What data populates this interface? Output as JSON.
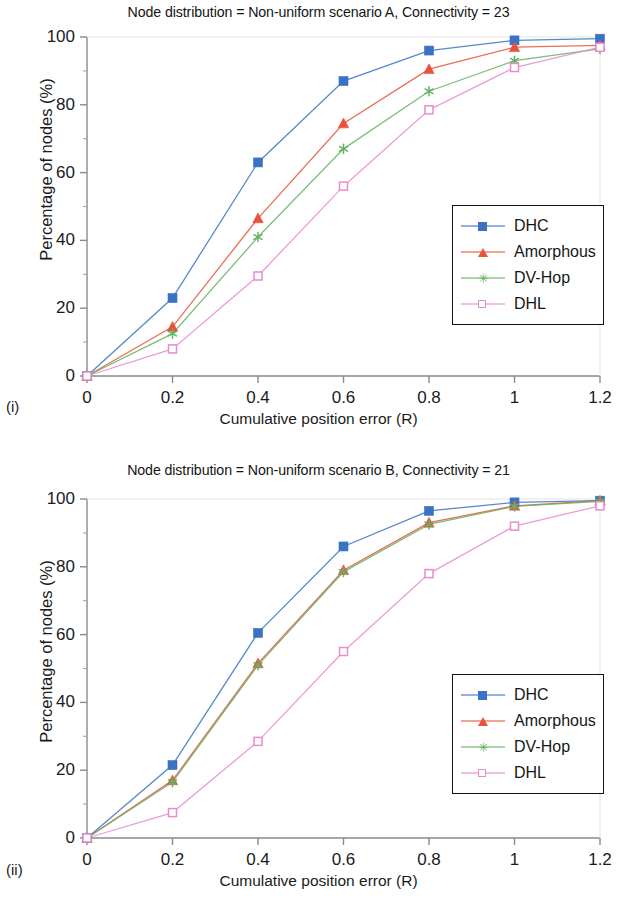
{
  "figure": {
    "panels": [
      {
        "subfig_label": "(i)",
        "title": "Node distribution = Non-uniform scenario A, Connectivity = 23",
        "xlabel": "Cumulative position error (R)",
        "ylabel": "Percentage of nodes (%)"
      },
      {
        "subfig_label": "(ii)",
        "title": "Node distribution = Non-uniform scenario B, Connectivity = 21",
        "xlabel": "Cumulative position error (R)",
        "ylabel": "Percentage of nodes (%)"
      }
    ]
  },
  "legend": {
    "items": [
      {
        "label": "DHC",
        "color": "#3A72C4",
        "marker": "filled-square"
      },
      {
        "label": "Amorphous",
        "color": "#E8533A",
        "marker": "filled-triangle"
      },
      {
        "label": "DV-Hop",
        "color": "#63B363",
        "marker": "star"
      },
      {
        "label": "DHL",
        "color": "#E88BD0",
        "marker": "open-square"
      }
    ]
  },
  "axes": {
    "x_ticks": [
      "0",
      "0.2",
      "0.4",
      "0.6",
      "0.8",
      "1",
      "1.2"
    ],
    "y_ticks": [
      "0",
      "20",
      "40",
      "60",
      "80",
      "100"
    ],
    "xlim": [
      0,
      1.2
    ],
    "ylim": [
      0,
      100
    ]
  },
  "chart_data": [
    {
      "type": "line",
      "id": "panel-i",
      "title": "Node distribution = Non-uniform scenario A, Connectivity = 23",
      "xlabel": "Cumulative position error (R)",
      "ylabel": "Percentage of nodes (%)",
      "x": [
        0,
        0.2,
        0.4,
        0.6,
        0.8,
        1.0,
        1.2
      ],
      "xlim": [
        0,
        1.2
      ],
      "ylim": [
        0,
        100
      ],
      "xtick_labels": [
        "0",
        "0.2",
        "0.4",
        "0.6",
        "0.8",
        "1",
        "1.2"
      ],
      "ytick_labels": [
        "0",
        "20",
        "40",
        "60",
        "80",
        "100"
      ],
      "grid": false,
      "legend_position": "center-right",
      "series": [
        {
          "name": "DHC",
          "color": "#3A72C4",
          "marker": "filled-square",
          "values": [
            0,
            23,
            63,
            87,
            96,
            99,
            99.5
          ]
        },
        {
          "name": "Amorphous",
          "color": "#E8533A",
          "marker": "filled-triangle",
          "values": [
            0,
            14.5,
            46.5,
            74.5,
            90.5,
            97,
            97.5
          ]
        },
        {
          "name": "DV-Hop",
          "color": "#63B363",
          "marker": "star",
          "values": [
            0,
            12.5,
            41,
            67,
            84,
            93,
            96.5
          ]
        },
        {
          "name": "DHL",
          "color": "#E88BD0",
          "marker": "open-square",
          "values": [
            0,
            8,
            29.5,
            56,
            78.5,
            91,
            97
          ]
        }
      ]
    },
    {
      "type": "line",
      "id": "panel-ii",
      "title": "Node distribution = Non-uniform scenario B, Connectivity = 21",
      "xlabel": "Cumulative position error (R)",
      "ylabel": "Percentage of nodes (%)",
      "x": [
        0,
        0.2,
        0.4,
        0.6,
        0.8,
        1.0,
        1.2
      ],
      "xlim": [
        0,
        1.2
      ],
      "ylim": [
        0,
        100
      ],
      "xtick_labels": [
        "0",
        "0.2",
        "0.4",
        "0.6",
        "0.8",
        "1",
        "1.2"
      ],
      "ytick_labels": [
        "0",
        "20",
        "40",
        "60",
        "80",
        "100"
      ],
      "grid": false,
      "legend_position": "center-right",
      "series": [
        {
          "name": "DHC",
          "color": "#3A72C4",
          "marker": "filled-square",
          "values": [
            0,
            21.5,
            60.5,
            86,
            96.5,
            99,
            99.5
          ]
        },
        {
          "name": "Amorphous",
          "color": "#E8533A",
          "marker": "filled-triangle",
          "values": [
            0,
            17,
            51.5,
            79,
            93,
            98,
            99.5
          ]
        },
        {
          "name": "DV-Hop",
          "color": "#63B363",
          "marker": "star",
          "values": [
            0,
            16.5,
            51,
            78.5,
            92.5,
            97.8,
            99.3
          ]
        },
        {
          "name": "DHL",
          "color": "#E88BD0",
          "marker": "open-square",
          "values": [
            0,
            7.5,
            28.5,
            55,
            78,
            92,
            98
          ]
        }
      ]
    }
  ]
}
